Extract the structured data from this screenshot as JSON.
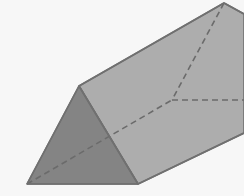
{
  "canvas": {
    "width": 244,
    "height": 196,
    "background_color": "#f7f7f7",
    "title": "Triangular prism solid figure"
  },
  "figure": {
    "name": "triangular-prism",
    "projection": "oblique",
    "outline_color": "#707070",
    "outline_width": 1.6,
    "hidden_edge_color": "#6b6b6b",
    "hidden_edge_width": 1.6,
    "hidden_edge_dash": "6 4"
  },
  "colors": {
    "background": "#f7f7f7",
    "front_triangle_fill": "#848484",
    "top_rectangle_fill": "#adadad",
    "side_rectangle_fill": "#a0a0a0",
    "edge_stroke": "#707070",
    "hidden_stroke": "#6b6b6b"
  },
  "vertices": {
    "front_apex": {
      "label": "A",
      "x": 79,
      "y": 86
    },
    "front_bottom_left": {
      "label": "B",
      "x": 27,
      "y": 184
    },
    "front_bottom_right": {
      "label": "C",
      "x": 138,
      "y": 184
    },
    "back_apex": {
      "label": "D",
      "x": 224,
      "y": 3
    },
    "back_bottom_hidden": {
      "label": "E",
      "x": 172,
      "y": 100
    },
    "back_bottom_right_offscreen": {
      "label": "F",
      "x": 286,
      "y": 100
    },
    "bottom_edge_exit": {
      "label": "G",
      "x": 244,
      "y": 133
    },
    "top_edge_exit": {
      "label": "H",
      "x": 244,
      "y": 14
    }
  },
  "faces": [
    {
      "name": "front-triangle-face",
      "kind": "triangle",
      "shading": "dark",
      "fill": "#848484",
      "points": "79,86 27,184 138,184"
    },
    {
      "name": "top-rectangle-face",
      "kind": "parallelogram",
      "shading": "light",
      "fill": "#adadad",
      "points": "79,86 224,3 244,14 244,133 138,184"
    }
  ],
  "visible_edges": [
    {
      "name": "front-triangle-upper-left-edge",
      "from": "front_apex",
      "to": "front_bottom_left"
    },
    {
      "name": "front-triangle-base-edge",
      "from": "front_bottom_left",
      "to": "front_bottom_right"
    },
    {
      "name": "front-triangle-right-edge",
      "from": "front_apex",
      "to": "front_bottom_right"
    },
    {
      "name": "top-ridge-edge",
      "from": "front_apex",
      "to": "back_apex"
    },
    {
      "name": "bottom-right-long-edge",
      "from": "front_bottom_right",
      "to": "bottom_edge_exit"
    },
    {
      "name": "back-apex-right-edge",
      "from": "back_apex",
      "to": "top_edge_exit"
    }
  ],
  "hidden_edges": [
    {
      "name": "hidden-back-slant-edge",
      "from": "front_bottom_left",
      "to": "back_bottom_hidden"
    },
    {
      "name": "hidden-back-vertical-edge",
      "from": "back_apex",
      "to": "back_bottom_hidden"
    },
    {
      "name": "hidden-back-base-edge",
      "from": "back_bottom_hidden",
      "to": "back_bottom_right_offscreen"
    }
  ]
}
